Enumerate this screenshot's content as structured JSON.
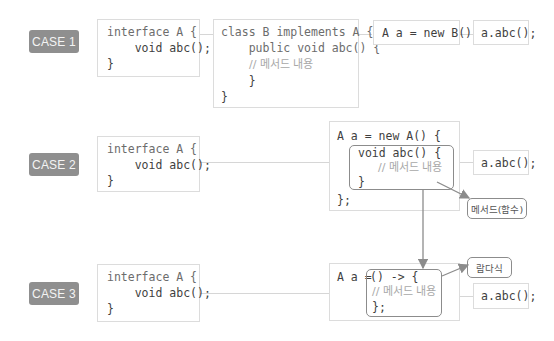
{
  "cases": [
    {
      "label": "CASE 1",
      "interface_code": [
        "interface A {",
        "    void abc();",
        "}"
      ],
      "class_code": [
        "class B implements A {",
        "    public void abc() {",
        "        // 메서드 내용",
        "    }",
        "}"
      ],
      "instantiation": "A a = new B();",
      "call": "a.abc();"
    },
    {
      "label": "CASE 2",
      "interface_code": [
        "interface A {",
        "    void abc();",
        "}"
      ],
      "anonymous_code": {
        "open": "A a = new A() {",
        "method_open": "void abc() {",
        "comment": "// 메서드 내용",
        "method_close": "}",
        "close": "};"
      },
      "call": "a.abc();",
      "annotation": "메서드(함수)"
    },
    {
      "label": "CASE 3",
      "interface_code": [
        "interface A {",
        "    void abc();",
        "}"
      ],
      "lambda_code": {
        "prefix": "A a = ",
        "open": "() -> {",
        "comment": "// 메서드 내용",
        "close": "};"
      },
      "call": "a.abc();",
      "annotation": "람다식"
    }
  ],
  "colors": {
    "badge": "#8f8f8f",
    "box_border": "#dcdcdc",
    "highlight_border": "#8c8c8c",
    "text": "#3f3f3f",
    "comment": "#a8a8a8"
  }
}
